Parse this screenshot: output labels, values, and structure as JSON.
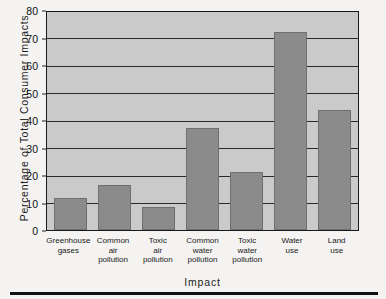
{
  "chart_data": {
    "type": "bar",
    "title": "",
    "subtitle": "",
    "xlabel": "Impact",
    "ylabel": "Percentage of Total Consumer Impacts",
    "categories": [
      "Greenhouse gases",
      "Common air pollution",
      "Toxic air pollution",
      "Common water pollution",
      "Toxic water pollution",
      "Water use",
      "Land use"
    ],
    "category_lines": [
      [
        "Greenhouse",
        "gases"
      ],
      [
        "Common",
        "air",
        "pollution"
      ],
      [
        "Toxic",
        "air",
        "pollution"
      ],
      [
        "Common",
        "water",
        "pollution"
      ],
      [
        "Toxic",
        "water",
        "pollution"
      ],
      [
        "Water",
        "use"
      ],
      [
        "Land",
        "use"
      ]
    ],
    "values": [
      11.5,
      16.5,
      8.5,
      37,
      21,
      72,
      43.5
    ],
    "ylim": [
      0,
      80
    ],
    "yticks": [
      0,
      10,
      20,
      30,
      40,
      50,
      60,
      70,
      80
    ],
    "ytick_labels": [
      "0",
      "10",
      "20",
      "30",
      "40",
      "50",
      "60",
      "70",
      "80"
    ],
    "grid": true,
    "grid_axis": "y",
    "legend": false,
    "legend_position": "none",
    "bar_color": "#8b8b8b",
    "plot_background": "#cacaca",
    "axis_color": "#1a1a1a",
    "figure_background": "#f4f3f1"
  }
}
